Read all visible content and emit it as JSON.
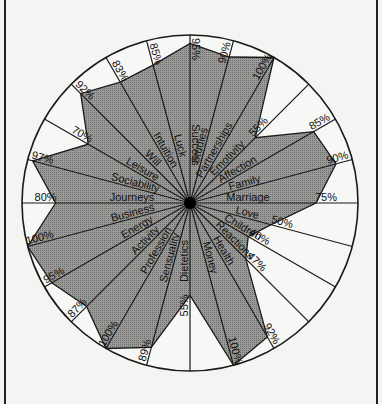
{
  "chart_data": {
    "type": "radar",
    "title": "",
    "unit": "%",
    "range": [
      0,
      100
    ],
    "start_angle_deg": 0,
    "direction": "clockwise",
    "categories": [
      "Success",
      "Studies",
      "Partnerships",
      "Emotivity",
      "Affection",
      "Family",
      "Marriage",
      "Love",
      "Children",
      "Reactions",
      "Health",
      "Money",
      "Dietetics",
      "Sensuality",
      "Profession",
      "Activity",
      "Energy",
      "Business",
      "Journeys",
      "Sociability",
      "Leisure",
      "Will",
      "Intuition",
      "Luck"
    ],
    "values": [
      95,
      90,
      100,
      55,
      85,
      90,
      75,
      50,
      40,
      47,
      92,
      100,
      55,
      89,
      100,
      87,
      95,
      100,
      80,
      97,
      70,
      92,
      83,
      85
    ],
    "value_labels": [
      "95%",
      "90%",
      "100%",
      "55%",
      "85%",
      "90%",
      "75%",
      "50%",
      "40%",
      "47%",
      "92%",
      "100%",
      "55%",
      "89%",
      "100%",
      "87%",
      "95%",
      "100%",
      "80%",
      "97%",
      "70%",
      "92%",
      "83%",
      "85%"
    ],
    "grid": false,
    "legend": null
  },
  "colors": {
    "fill": "#8e8e8c",
    "line": "#1a1a1a",
    "background": "#f4f4f2",
    "center": "#000000"
  }
}
